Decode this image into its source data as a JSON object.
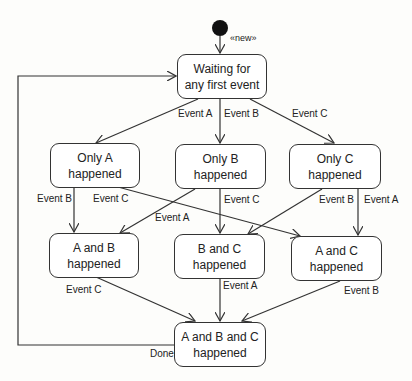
{
  "diagram": {
    "type": "uml-state-machine",
    "initial_stereotype": "«new»",
    "states": {
      "waiting": {
        "label": "Waiting for\nany first event"
      },
      "only_a": {
        "label": "Only A\nhappened"
      },
      "only_b": {
        "label": "Only B\nhappened"
      },
      "only_c": {
        "label": "Only C\nhappened"
      },
      "a_and_b": {
        "label": "A and B\nhappened"
      },
      "b_and_c": {
        "label": "B and C\nhappened"
      },
      "a_and_c": {
        "label": "A and C\nhappened"
      },
      "all": {
        "label": "A and B and C\nhappened"
      }
    },
    "transitions": [
      {
        "from": "initial",
        "to": "waiting",
        "label": ""
      },
      {
        "from": "waiting",
        "to": "only_a",
        "label": "Event A"
      },
      {
        "from": "waiting",
        "to": "only_b",
        "label": "Event B"
      },
      {
        "from": "waiting",
        "to": "only_c",
        "label": "Event C"
      },
      {
        "from": "only_a",
        "to": "a_and_b",
        "label": "Event B"
      },
      {
        "from": "only_a",
        "to": "a_and_c",
        "label": "Event C"
      },
      {
        "from": "only_b",
        "to": "a_and_b",
        "label": "Event A"
      },
      {
        "from": "only_b",
        "to": "b_and_c",
        "label": "Event C"
      },
      {
        "from": "only_c",
        "to": "b_and_c",
        "label": "Event B"
      },
      {
        "from": "only_c",
        "to": "a_and_c",
        "label": "Event A"
      },
      {
        "from": "a_and_b",
        "to": "all",
        "label": "Event C"
      },
      {
        "from": "b_and_c",
        "to": "all",
        "label": "Event A"
      },
      {
        "from": "a_and_c",
        "to": "all",
        "label": "Event B"
      },
      {
        "from": "all",
        "to": "waiting",
        "label": "Done"
      }
    ]
  }
}
